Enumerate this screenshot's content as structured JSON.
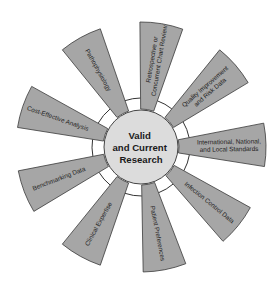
{
  "diagram": {
    "center": {
      "lines": [
        "Valid",
        "and Current",
        "Research"
      ]
    },
    "colors": {
      "wedge_fill": "#a6a6a6",
      "wedge_stroke": "#3a3a3a",
      "center_fill": "#dcdcdc",
      "text": "#1e1e1e"
    },
    "spokes": [
      {
        "id": "retrospective",
        "angle": 9.5,
        "lines": [
          "Retrospective or",
          "Concurrent Chart Review"
        ]
      },
      {
        "id": "quality",
        "angle": 49,
        "lines": [
          "Quality Improvement",
          "and Risk Data"
        ]
      },
      {
        "id": "international",
        "angle": 89,
        "lines": [
          "International, National,",
          "and Local Standards"
        ]
      },
      {
        "id": "infection",
        "angle": 129,
        "lines": [
          "Infection Control Data"
        ]
      },
      {
        "id": "patient",
        "angle": 169,
        "lines": [
          "Patient Preferences"
        ]
      },
      {
        "id": "clinical",
        "angle": 209,
        "lines": [
          "Clinical Expertise"
        ]
      },
      {
        "id": "benchmarking",
        "angle": 249,
        "lines": [
          "Benchmarking Data"
        ]
      },
      {
        "id": "cost",
        "angle": 289,
        "lines": [
          "Cost-Effective Analysis"
        ]
      },
      {
        "id": "pathophysiology",
        "angle": 331,
        "lines": [
          "Pathophysiology"
        ]
      }
    ]
  }
}
